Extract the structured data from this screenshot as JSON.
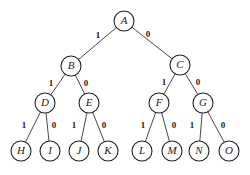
{
  "diagram": {
    "type": "binary-tree",
    "nodes": [
      {
        "id": "A",
        "label": "A",
        "x": 124,
        "y": 21
      },
      {
        "id": "B",
        "label": "B",
        "x": 71,
        "y": 66
      },
      {
        "id": "C",
        "label": "C",
        "x": 180,
        "y": 65
      },
      {
        "id": "D",
        "label": "D",
        "x": 45,
        "y": 103
      },
      {
        "id": "E",
        "label": "E",
        "x": 89,
        "y": 103
      },
      {
        "id": "F",
        "label": "F",
        "x": 159,
        "y": 103
      },
      {
        "id": "G",
        "label": "G",
        "x": 203,
        "y": 103
      },
      {
        "id": "H",
        "label": "H",
        "x": 21,
        "y": 151
      },
      {
        "id": "I",
        "label": "I",
        "x": 50,
        "y": 151
      },
      {
        "id": "J",
        "label": "J",
        "x": 79,
        "y": 151
      },
      {
        "id": "K",
        "label": "K",
        "x": 108,
        "y": 151
      },
      {
        "id": "L",
        "label": "L",
        "x": 142,
        "y": 151
      },
      {
        "id": "M",
        "label": "M",
        "x": 172,
        "y": 151
      },
      {
        "id": "N",
        "label": "N",
        "x": 199,
        "y": 151
      },
      {
        "id": "O",
        "label": "O",
        "x": 229,
        "y": 151
      }
    ],
    "edges": [
      {
        "from": "A",
        "to": "B",
        "label": "1",
        "lx": 98,
        "ly": 36
      },
      {
        "from": "A",
        "to": "C",
        "label": "0",
        "lx": 148,
        "ly": 35
      },
      {
        "from": "B",
        "to": "D",
        "label": "1",
        "lx": 51,
        "ly": 84
      },
      {
        "from": "B",
        "to": "E",
        "label": "0",
        "lx": 86,
        "ly": 84
      },
      {
        "from": "C",
        "to": "F",
        "label": "1",
        "lx": 164,
        "ly": 83
      },
      {
        "from": "C",
        "to": "G",
        "label": "0",
        "lx": 198,
        "ly": 83
      },
      {
        "from": "D",
        "to": "H",
        "label": "1",
        "lx": 24,
        "ly": 126
      },
      {
        "from": "D",
        "to": "I",
        "label": "0",
        "lx": 54,
        "ly": 126
      },
      {
        "from": "E",
        "to": "J",
        "label": "1",
        "lx": 74,
        "ly": 126
      },
      {
        "from": "E",
        "to": "K",
        "label": "0",
        "lx": 104,
        "ly": 126
      },
      {
        "from": "F",
        "to": "L",
        "label": "1",
        "lx": 143,
        "ly": 126
      },
      {
        "from": "F",
        "to": "M",
        "label": "0",
        "lx": 174,
        "ly": 126
      },
      {
        "from": "G",
        "to": "N",
        "label": "1",
        "lx": 192,
        "ly": 126
      },
      {
        "from": "G",
        "to": "O",
        "label": "0",
        "lx": 223,
        "ly": 126
      }
    ],
    "node_radius": 10
  }
}
